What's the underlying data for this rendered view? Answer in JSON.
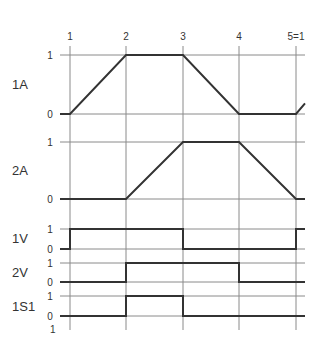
{
  "diagram": {
    "steps": [
      "1",
      "2",
      "3",
      "4",
      "5=1"
    ],
    "step_x": [
      70,
      126,
      183,
      239,
      296
    ],
    "grid_left": 60,
    "grid_right": 305,
    "grid_top": 46,
    "grid_bottom": 330,
    "bottom_level_label": "1",
    "colors": {
      "grid": "#8a8a8a",
      "signal": "#333333",
      "text": "#333333"
    },
    "rows": [
      {
        "label": "1A",
        "label_y": 89,
        "y1": 55,
        "y0": 114,
        "type": "ramp",
        "levels": [
          "1",
          "0"
        ],
        "points": [
          [
            60,
            0
          ],
          [
            70,
            0
          ],
          [
            126,
            1
          ],
          [
            183,
            1
          ],
          [
            239,
            0
          ],
          [
            296,
            0
          ],
          [
            305,
            0.18
          ]
        ]
      },
      {
        "label": "2A",
        "label_y": 175,
        "y1": 142,
        "y0": 199,
        "type": "ramp",
        "levels": [
          "1",
          "0"
        ],
        "points": [
          [
            60,
            0
          ],
          [
            126,
            0
          ],
          [
            183,
            1
          ],
          [
            239,
            1
          ],
          [
            296,
            0
          ],
          [
            305,
            0
          ]
        ]
      },
      {
        "label": "1V",
        "label_y": 243,
        "y1": 229,
        "y0": 249,
        "type": "step",
        "levels": [
          "1",
          "0"
        ],
        "points": [
          [
            60,
            0
          ],
          [
            70,
            0
          ],
          [
            70,
            1
          ],
          [
            183,
            1
          ],
          [
            183,
            0
          ],
          [
            296,
            0
          ],
          [
            296,
            1
          ],
          [
            305,
            1
          ]
        ]
      },
      {
        "label": "2V",
        "label_y": 277,
        "y1": 263,
        "y0": 282,
        "type": "step",
        "levels": [
          "1",
          "0"
        ],
        "points": [
          [
            60,
            0
          ],
          [
            126,
            0
          ],
          [
            126,
            1
          ],
          [
            239,
            1
          ],
          [
            239,
            0
          ],
          [
            305,
            0
          ]
        ]
      },
      {
        "label": "1S1",
        "label_y": 311,
        "y1": 296,
        "y0": 316,
        "type": "step",
        "levels": [
          "1",
          "0"
        ],
        "points": [
          [
            60,
            0
          ],
          [
            126,
            0
          ],
          [
            126,
            1
          ],
          [
            183,
            1
          ],
          [
            183,
            0
          ],
          [
            305,
            0
          ]
        ]
      }
    ]
  }
}
